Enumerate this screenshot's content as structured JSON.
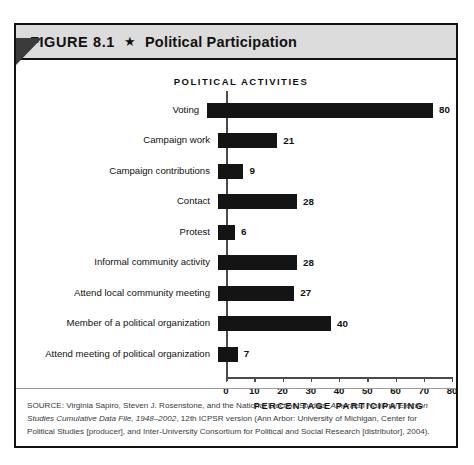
{
  "figure": {
    "number_label": "FIGURE 8.1",
    "star_glyph": "★",
    "title": "Political Participation",
    "header_bg": "#dcdcdc",
    "border_color": "#111111",
    "bar_color": "#141414"
  },
  "chart_data": {
    "type": "bar",
    "orientation": "horizontal",
    "title": "POLITICAL ACTIVITIES",
    "xlabel": "PERCENTAGE PARTICIPATING",
    "ylabel": "",
    "xlim": [
      0,
      80
    ],
    "grid": false,
    "legend": "none",
    "xticks": [
      0,
      10,
      20,
      30,
      40,
      50,
      60,
      70,
      80
    ],
    "xtick_labels": [
      "0",
      "10",
      "20",
      "30",
      "40",
      "50",
      "60",
      "70",
      "80"
    ],
    "categories": [
      "Voting",
      "Campaign work",
      "Campaign contributions",
      "Contact",
      "Protest",
      "Informal community activity",
      "Attend local community meeting",
      "Member of a political organization",
      "Attend meeting of political organization"
    ],
    "values": [
      80,
      21,
      9,
      28,
      6,
      28,
      27,
      40,
      7
    ],
    "value_labels": [
      "80",
      "21",
      "9",
      "28",
      "6",
      "28",
      "27",
      "40",
      "7"
    ]
  },
  "source": {
    "line1_a": "SOURCE: Virginia Sapiro, Steven J. Rosenstone, and the National Election Studies, ",
    "line1_italic": "American National Election",
    "line2_italic_a": "Studies Cumulative Data File, 1948–2002",
    "line2_b": ", 12th ICPSR version (Ann Arbor: University of Michigan, Center for Political",
    "line3": "Studies [producer], and Inter-University Consortium for Political and Social Research [distributor], 2004)."
  }
}
